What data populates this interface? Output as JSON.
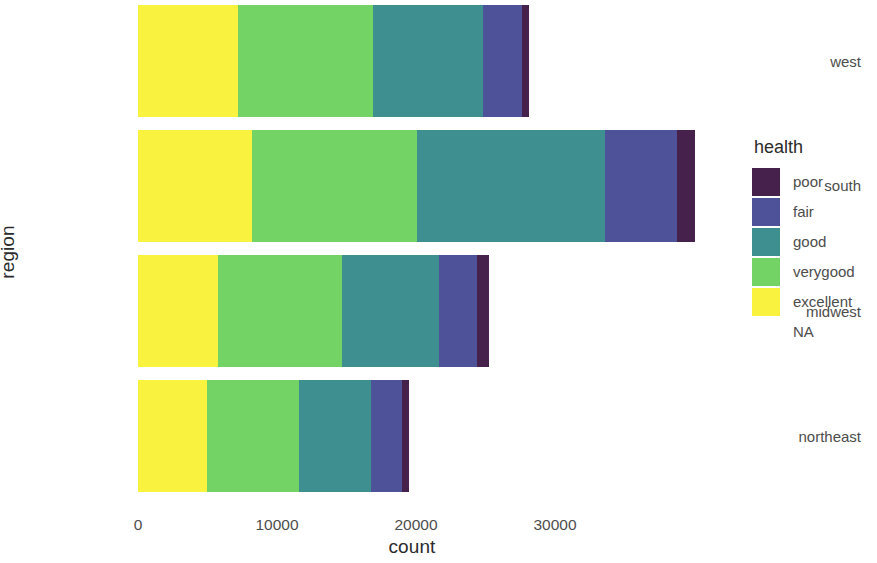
{
  "chart_data": {
    "type": "bar",
    "orientation": "horizontal",
    "stacked": true,
    "title": "",
    "xlabel": "count",
    "ylabel": "region",
    "categories": [
      "northeast",
      "midwest",
      "south",
      "west"
    ],
    "category_order_top_to_bottom": [
      "west",
      "south",
      "midwest",
      "northeast"
    ],
    "series": [
      {
        "name": "excellent",
        "color": "#f9f23e",
        "values": [
          4950,
          5750,
          8200,
          7200
        ]
      },
      {
        "name": "verygood",
        "color": "#74d365",
        "values": [
          6600,
          8900,
          11900,
          9700
        ]
      },
      {
        "name": "good",
        "color": "#3e9090",
        "values": [
          5200,
          7000,
          13500,
          7900
        ]
      },
      {
        "name": "fair",
        "color": "#4e5399",
        "values": [
          2250,
          2750,
          5200,
          2800
        ]
      },
      {
        "name": "poor",
        "color": "#46214c",
        "values": [
          500,
          850,
          1300,
          500
        ]
      },
      {
        "name": "NA",
        "color": "#ffffff",
        "values": [
          0,
          0,
          0,
          0
        ]
      }
    ],
    "totals": [
      19500,
      25250,
      40100,
      28100
    ],
    "xlim": [
      0,
      33000
    ],
    "x_ticks": [
      0,
      10000,
      20000,
      30000
    ],
    "x_tick_labels": [
      "0",
      "10000",
      "20000",
      "30000"
    ],
    "grid": false,
    "legend_position": "right"
  },
  "axes": {
    "x_title": "count",
    "y_title": "region",
    "x_ticks": [
      {
        "label": "0",
        "value": 0
      },
      {
        "label": "10000",
        "value": 10000
      },
      {
        "label": "20000",
        "value": 20000
      },
      {
        "label": "30000",
        "value": 30000
      }
    ],
    "y_ticks": [
      {
        "label": "west"
      },
      {
        "label": "south"
      },
      {
        "label": "midwest"
      },
      {
        "label": "northeast"
      }
    ]
  },
  "legend": {
    "title": "health",
    "items": [
      {
        "label": "poor",
        "color": "#46214c"
      },
      {
        "label": "fair",
        "color": "#4e5399"
      },
      {
        "label": "good",
        "color": "#3e9090"
      },
      {
        "label": "verygood",
        "color": "#74d365"
      },
      {
        "label": "excellent",
        "color": "#f9f23e"
      },
      {
        "label": "NA",
        "color": "#ffffff"
      }
    ]
  }
}
